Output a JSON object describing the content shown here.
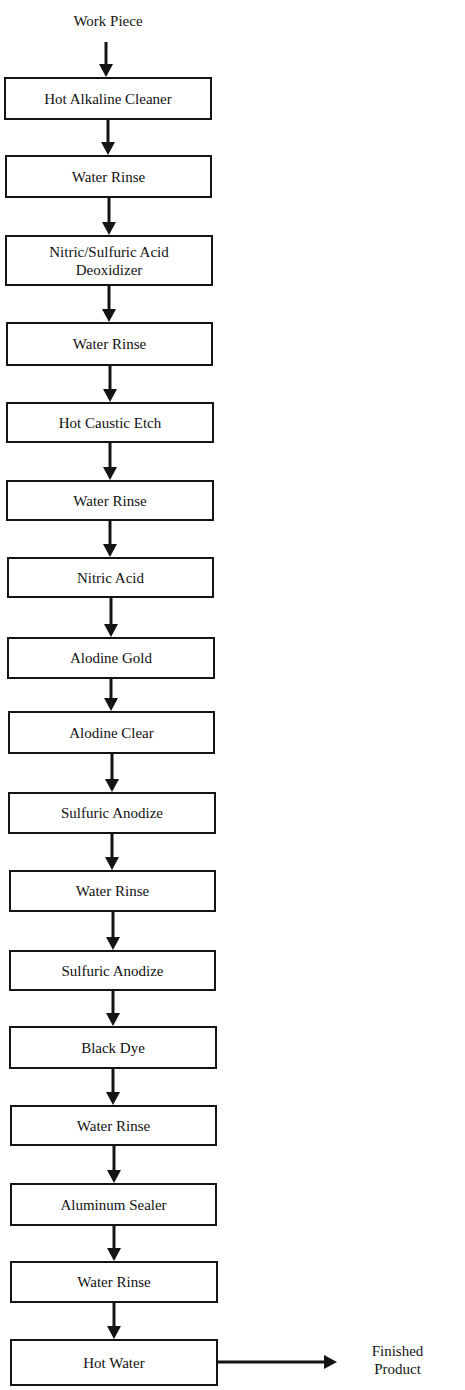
{
  "diagram": {
    "type": "process-flowchart",
    "start_label": "Work Piece",
    "end_label_line1": "Finished",
    "end_label_line2": "Product",
    "steps": [
      {
        "line1": "Hot Alkaline Cleaner",
        "line2": ""
      },
      {
        "line1": "Water Rinse",
        "line2": ""
      },
      {
        "line1": "Nitric/Sulfuric Acid",
        "line2": "Deoxidizer"
      },
      {
        "line1": "Water Rinse",
        "line2": ""
      },
      {
        "line1": "Hot Caustic Etch",
        "line2": ""
      },
      {
        "line1": "Water Rinse",
        "line2": ""
      },
      {
        "line1": "Nitric Acid",
        "line2": ""
      },
      {
        "line1": "Alodine Gold",
        "line2": ""
      },
      {
        "line1": "Alodine Clear",
        "line2": ""
      },
      {
        "line1": "Sulfuric Anodize",
        "line2": ""
      },
      {
        "line1": "Water Rinse",
        "line2": ""
      },
      {
        "line1": "Sulfuric Anodize",
        "line2": ""
      },
      {
        "line1": "Black Dye",
        "line2": ""
      },
      {
        "line1": "Water Rinse",
        "line2": ""
      },
      {
        "line1": "Aluminum Sealer",
        "line2": ""
      },
      {
        "line1": "Water Rinse",
        "line2": ""
      },
      {
        "line1": "Hot Water",
        "line2": ""
      }
    ],
    "colors": {
      "stroke": "#141414",
      "background": "#ffffff",
      "text": "#151515"
    }
  }
}
